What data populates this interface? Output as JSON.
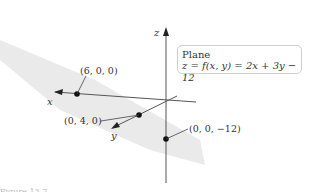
{
  "diagram": {
    "axes": {
      "x": "x",
      "y": "y",
      "z": "z"
    },
    "legend": {
      "title": "Plane",
      "equation": "z = f(x, y) = 2x + 3y − 12"
    },
    "points": [
      {
        "label": "(6, 0, 0)"
      },
      {
        "label": "(0, 4, 0)"
      },
      {
        "label": "(0, 0, −12)"
      }
    ],
    "caption": "Figure 13.7"
  }
}
